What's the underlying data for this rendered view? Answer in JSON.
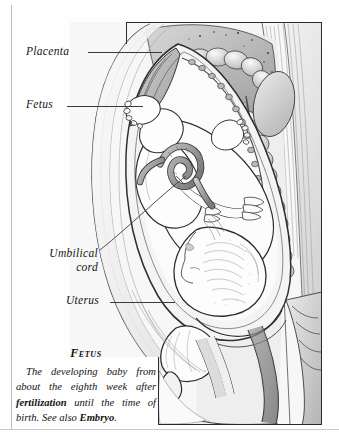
{
  "page": {
    "background_color": "#fefefe",
    "ink_color": "#141414",
    "rule_color": "#b9b9b9",
    "plate_border_color": "#2b2b2b"
  },
  "labels": [
    {
      "id": "placenta",
      "text": "Placenta",
      "has_leader": true
    },
    {
      "id": "fetus",
      "text": "Fetus",
      "has_leader": true
    },
    {
      "id": "umbilical",
      "text": "Umbilical cord",
      "line1": "Umbilical",
      "line2": "cord",
      "has_leader": true
    },
    {
      "id": "uterus",
      "text": "Uterus",
      "has_leader": true
    }
  ],
  "caption": {
    "heading": "Fetus",
    "text_part_1": "The developing baby from about the eighth week after ",
    "text_bold_1": "fertilization",
    "text_part_2": " until the time of birth. See also ",
    "text_bold_2": "Embryo",
    "text_part_3": "."
  },
  "illustration": {
    "title": "sagittal-section-pregnant-abdomen",
    "description": "Pen-and-ink anatomical cross-section showing a fetus in the uterus within a pregnant abdomen",
    "structures": [
      "placenta",
      "fetus",
      "umbilical-cord",
      "uterus",
      "intestines",
      "spine",
      "bladder",
      "pubic-bone",
      "rectum",
      "abdominal-wall",
      "kidney"
    ]
  }
}
